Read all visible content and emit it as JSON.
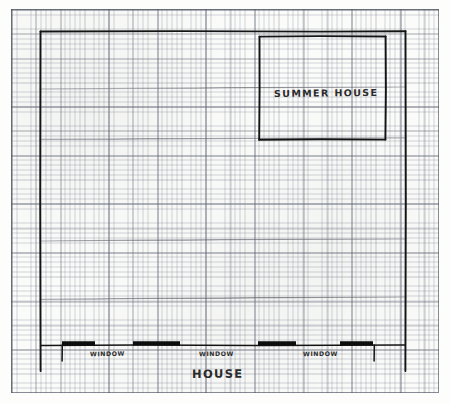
{
  "document": {
    "type": "hand-drawn-floor-plan",
    "medium": "graph-paper",
    "ink_color": "#1a1a1a",
    "paper_color": "#fbfbfa",
    "grid_color": "#6e7682"
  },
  "labels": {
    "summer_house": "SUMMER HOUSE",
    "house": "HOUSE",
    "windows": [
      {
        "id": "window-1",
        "text": "WINDOW"
      },
      {
        "id": "window-2",
        "text": "WINDOW"
      },
      {
        "id": "window-3",
        "text": "WINDOW"
      }
    ]
  },
  "plan": {
    "house_outline": {
      "name": "house-outline",
      "left": 40,
      "top": 31,
      "right": 406,
      "bottom": 371
    },
    "summer_house_outline": {
      "name": "summer-house-outline",
      "left": 259,
      "top": 36,
      "right": 386,
      "bottom": 140
    },
    "front_wall_y": 345,
    "window_bars": [
      {
        "id": "window-bar-1",
        "x": 62,
        "width": 33
      },
      {
        "id": "window-bar-2",
        "x": 133,
        "width": 47
      },
      {
        "id": "window-bar-3",
        "x": 258,
        "width": 38
      },
      {
        "id": "window-bar-4",
        "x": 340,
        "width": 33
      }
    ],
    "wall_returns": [
      {
        "id": "wall-return-left",
        "x": 62,
        "top": 345,
        "bottom": 361
      },
      {
        "id": "wall-return-right",
        "x": 374,
        "top": 345,
        "bottom": 361
      }
    ],
    "guide_lines": [
      {
        "id": "guide-line-1",
        "x1": 40,
        "y1": 89,
        "x2": 406,
        "y2": 87
      },
      {
        "id": "guide-line-2",
        "x1": 40,
        "y1": 139,
        "x2": 406,
        "y2": 138
      },
      {
        "id": "guide-line-3",
        "x1": 40,
        "y1": 241,
        "x2": 406,
        "y2": 239
      },
      {
        "id": "guide-line-4",
        "x1": 40,
        "y1": 299,
        "x2": 406,
        "y2": 297
      }
    ]
  }
}
